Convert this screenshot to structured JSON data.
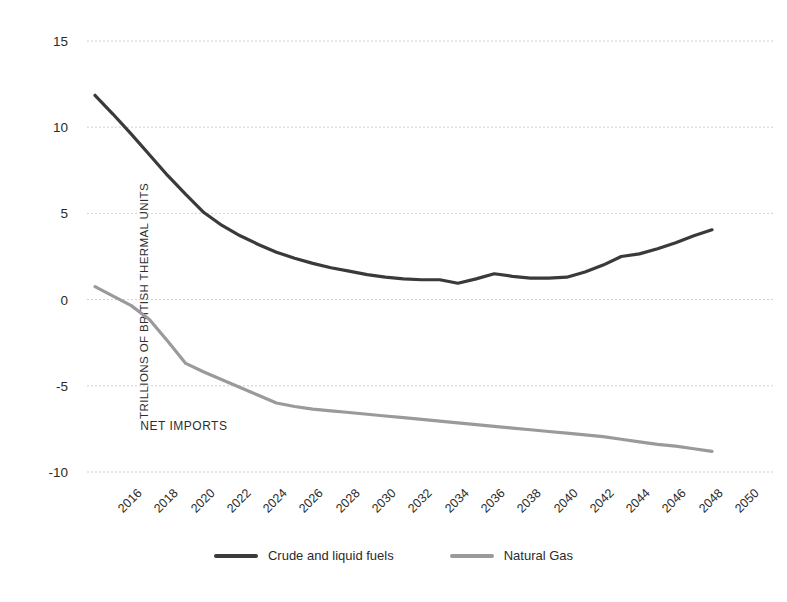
{
  "chart_data": {
    "type": "line",
    "title": "",
    "xlabel": "",
    "ylabel": "TRILLIONS OF BRITISH THERMAL UNITS",
    "ylim": [
      -10,
      15
    ],
    "xlim": [
      2016,
      2050
    ],
    "yticks": [
      "15",
      "10",
      "5",
      "0",
      "-5",
      "-10"
    ],
    "ytick_values": [
      15,
      10,
      5,
      0,
      -5,
      -10
    ],
    "grid": true,
    "grid_style": "dotted-horizontal",
    "legend_position": "bottom-center",
    "annotations": [
      {
        "text": "NET IMPORTS",
        "x": 2018.5,
        "y": -7.4
      }
    ],
    "x": [
      2016,
      2017,
      2018,
      2019,
      2020,
      2021,
      2022,
      2023,
      2024,
      2025,
      2026,
      2027,
      2028,
      2029,
      2030,
      2031,
      2032,
      2033,
      2034,
      2035,
      2036,
      2037,
      2038,
      2039,
      2040,
      2041,
      2042,
      2043,
      2044,
      2045,
      2046,
      2047,
      2048,
      2049,
      2050
    ],
    "xtick_labels": [
      "2016",
      "2018",
      "2020",
      "2022",
      "2024",
      "2026",
      "2028",
      "2030",
      "2032",
      "2034",
      "2036",
      "2038",
      "2040",
      "2042",
      "2044",
      "2046",
      "2048",
      "2050"
    ],
    "series": [
      {
        "name": "Crude and liquid fuels",
        "color": "#3a3a3a",
        "values": [
          11.85,
          10.75,
          9.6,
          8.4,
          7.2,
          6.1,
          5.05,
          4.3,
          3.7,
          3.2,
          2.75,
          2.4,
          2.1,
          1.85,
          1.65,
          1.45,
          1.3,
          1.2,
          1.15,
          1.15,
          0.95,
          1.2,
          1.5,
          1.35,
          1.25,
          1.25,
          1.3,
          1.6,
          2.0,
          2.5,
          2.65,
          2.95,
          3.3,
          3.7,
          4.05
        ]
      },
      {
        "name": "Natural Gas",
        "color": "#9a9a9a",
        "values": [
          0.75,
          0.2,
          -0.35,
          -1.15,
          -2.4,
          -3.7,
          -4.2,
          -4.65,
          -5.1,
          -5.55,
          -6.0,
          -6.2,
          -6.35,
          -6.45,
          -6.55,
          -6.65,
          -6.75,
          -6.85,
          -6.95,
          -7.05,
          -7.15,
          -7.25,
          -7.35,
          -7.45,
          -7.55,
          -7.65,
          -7.75,
          -7.85,
          -7.95,
          -8.1,
          -8.25,
          -8.4,
          -8.5,
          -8.65,
          -8.8
        ]
      }
    ]
  },
  "legend": {
    "items": [
      {
        "label": "Crude and liquid fuels",
        "color": "#3a3a3a"
      },
      {
        "label": "Natural Gas",
        "color": "#9a9a9a"
      }
    ]
  },
  "colors": {
    "crude": "#3a3a3a",
    "gas": "#9a9a9a",
    "grid": "#cfcfcf",
    "text": "#2b2b2b",
    "background": "#ffffff"
  }
}
